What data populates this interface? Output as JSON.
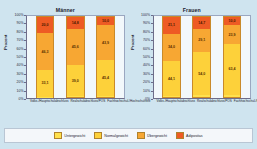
{
  "chart_data": {
    "type": "bar",
    "stacked": true,
    "ylabel": "Prozent",
    "xlabel": "",
    "ylim": [
      0,
      100
    ],
    "grid": false,
    "legend_position": "bottom",
    "ytick_labels": [
      "100%",
      "90%",
      "80%",
      "70%",
      "60%",
      "50%",
      "40%",
      "30%",
      "20%",
      "10%",
      "0%"
    ],
    "ytick_values": [
      100,
      90,
      80,
      70,
      60,
      50,
      40,
      30,
      20,
      10,
      0
    ],
    "categories": [
      "Volks-/Hauptschulabschluss",
      "Realschulabschluss/POS",
      "Fachhochschul-/Hochschulreife"
    ],
    "legend": [
      {
        "name": "Untergewicht",
        "color": "#ffe14d"
      },
      {
        "name": "Normalgewicht",
        "color": "#fdd13a"
      },
      {
        "name": "Übergewicht",
        "color": "#f7a733"
      },
      {
        "name": "Adipositas",
        "color": "#ee5b24"
      }
    ],
    "panels": [
      {
        "title": "Männer",
        "bars": [
          {
            "category": "Volks-/Hauptschulabschluss",
            "segments": [
              {
                "name": "Adipositas",
                "value": 20.0,
                "label": "20,0"
              },
              {
                "name": "Übergewicht",
                "value": 46.3,
                "label": "46,3"
              },
              {
                "name": "Normalgewicht",
                "value": 33.1,
                "label": "33,1"
              },
              {
                "name": "Untergewicht",
                "value": 0.6,
                "label": ""
              }
            ]
          },
          {
            "category": "Realschulabschluss/POS",
            "segments": [
              {
                "name": "Adipositas",
                "value": 14.8,
                "label": "14,8"
              },
              {
                "name": "Übergewicht",
                "value": 45.6,
                "label": "45,6"
              },
              {
                "name": "Normalgewicht",
                "value": 39.0,
                "label": "39,0"
              },
              {
                "name": "Untergewicht",
                "value": 0.6,
                "label": ""
              }
            ]
          },
          {
            "category": "Fachhochschul-/Hochschulreife",
            "segments": [
              {
                "name": "Adipositas",
                "value": 10.0,
                "label": "10,0"
              },
              {
                "name": "Übergewicht",
                "value": 43.9,
                "label": "43,9"
              },
              {
                "name": "Normalgewicht",
                "value": 45.4,
                "label": "45,4"
              },
              {
                "name": "Untergewicht",
                "value": 0.7,
                "label": ""
              }
            ]
          }
        ]
      },
      {
        "title": "Frauen",
        "bars": [
          {
            "category": "Volks-/Hauptschulabschluss",
            "segments": [
              {
                "name": "Adipositas",
                "value": 21.1,
                "label": "21,1"
              },
              {
                "name": "Übergewicht",
                "value": 34.0,
                "label": "34,0"
              },
              {
                "name": "Normalgewicht",
                "value": 44.1,
                "label": "44,1"
              },
              {
                "name": "Untergewicht",
                "value": 0.8,
                "label": ""
              }
            ]
          },
          {
            "category": "Realschulabschluss/POS",
            "segments": [
              {
                "name": "Adipositas",
                "value": 14.7,
                "label": "14,7"
              },
              {
                "name": "Übergewicht",
                "value": 29.1,
                "label": "29,1"
              },
              {
                "name": "Normalgewicht",
                "value": 54.0,
                "label": "54,0"
              },
              {
                "name": "Untergewicht",
                "value": 2.2,
                "label": ""
              }
            ]
          },
          {
            "category": "Fachhochschul-/Hochschulreife",
            "segments": [
              {
                "name": "Adipositas",
                "value": 10.0,
                "label": "10,0"
              },
              {
                "name": "Übergewicht",
                "value": 23.9,
                "label": "23,9"
              },
              {
                "name": "Normalgewicht",
                "value": 63.4,
                "label": "63,4"
              },
              {
                "name": "Untergewicht",
                "value": 2.7,
                "label": ""
              }
            ]
          }
        ]
      }
    ]
  }
}
